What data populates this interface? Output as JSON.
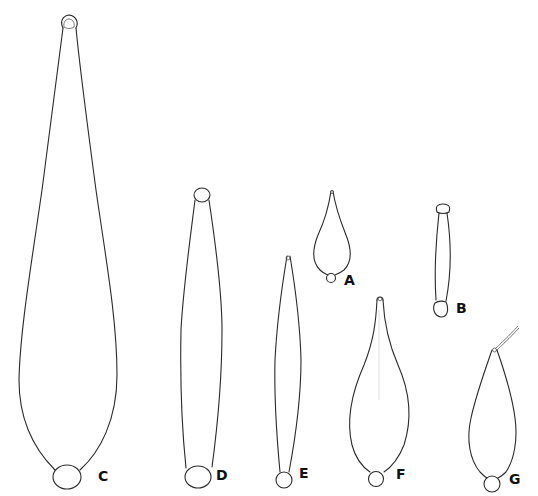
{
  "figure": {
    "type": "scientific line drawing",
    "background": "#ffffff",
    "stroke_color": "#2a2a2a",
    "specimens": [
      {
        "id": "C",
        "label": "C",
        "shape": "elongated club, narrow apex with terminal loop, broad rounded base with basal cell"
      },
      {
        "id": "D",
        "label": "D",
        "shape": "long spindle, circular apical and basal cells"
      },
      {
        "id": "E",
        "label": "E",
        "shape": "narrow spindle, pointed apex, basal cell"
      },
      {
        "id": "A",
        "label": "A",
        "shape": "small pyriform, pointed apex, small basal cell"
      },
      {
        "id": "B",
        "label": "B",
        "shape": "small rod, rounded ends"
      },
      {
        "id": "F",
        "label": "F",
        "shape": "flask shaped, narrow neck, basal cell"
      },
      {
        "id": "G",
        "label": "G",
        "shape": "pyriform with apical filament, basal cell"
      }
    ]
  }
}
